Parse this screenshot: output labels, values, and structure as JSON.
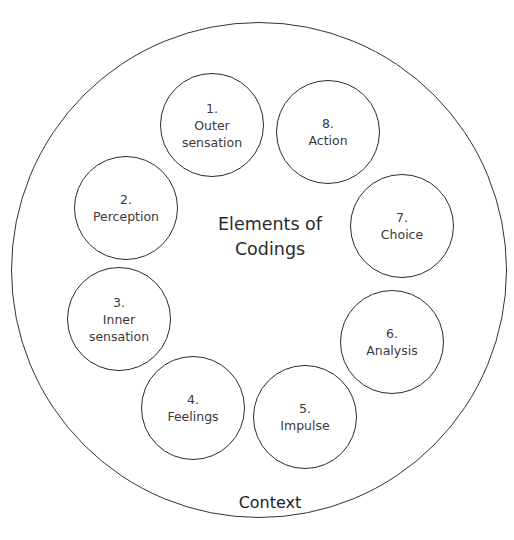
{
  "diagram": {
    "title": "Elements of\nCodings",
    "outer_label": "Context",
    "nodes": [
      {
        "num": "1.",
        "label": "Outer\nsensation",
        "cx": 212,
        "cy": 125
      },
      {
        "num": "2.",
        "label": "Perception",
        "cx": 126,
        "cy": 208
      },
      {
        "num": "3.",
        "label": "Inner\nsensation",
        "cx": 119,
        "cy": 319
      },
      {
        "num": "4.",
        "label": "Feelings",
        "cx": 193,
        "cy": 408
      },
      {
        "num": "5.",
        "label": "Impulse",
        "cx": 305,
        "cy": 417
      },
      {
        "num": "6.",
        "label": "Analysis",
        "cx": 392,
        "cy": 342
      },
      {
        "num": "7.",
        "label": "Choice",
        "cx": 402,
        "cy": 226
      },
      {
        "num": "8.",
        "label": "Action",
        "cx": 328,
        "cy": 132
      }
    ],
    "colors": {
      "stroke": "#2a2a2a",
      "text": "#3a3a3a",
      "background": "#ffffff"
    }
  }
}
